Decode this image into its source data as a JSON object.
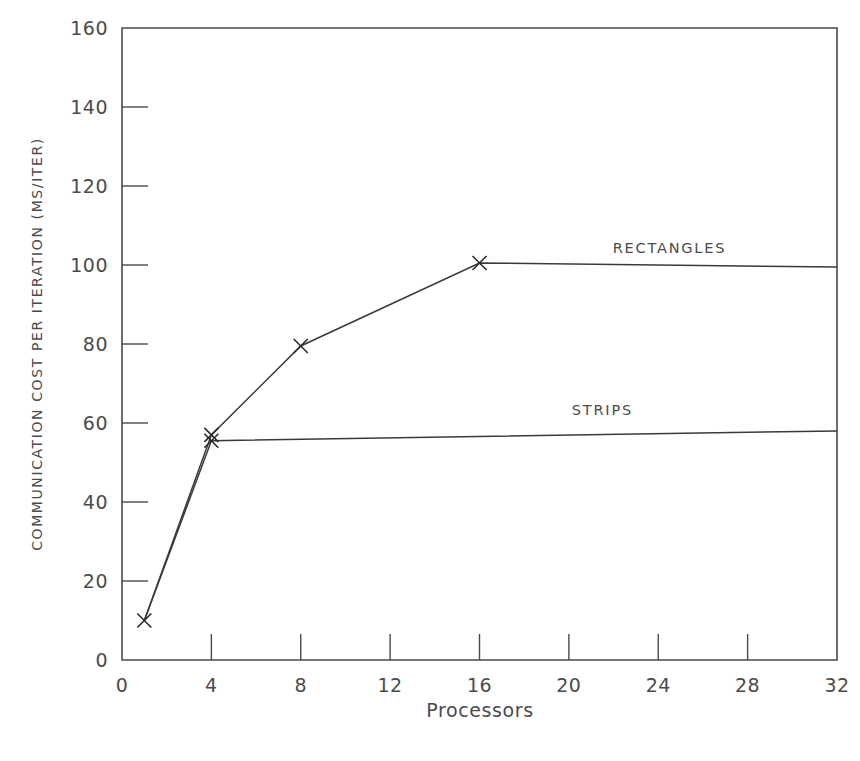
{
  "chart_data": {
    "type": "line",
    "title": "",
    "xlabel": "Processors",
    "ylabel": "COMMUNICATION COST PER ITERATION (MS/ITER)",
    "xlim": [
      0,
      32
    ],
    "ylim": [
      0,
      160
    ],
    "xticks": [
      0,
      4,
      8,
      12,
      16,
      20,
      24,
      28,
      32
    ],
    "yticks": [
      0,
      20,
      40,
      60,
      80,
      100,
      120,
      140,
      160
    ],
    "xtick_labels": [
      "0",
      "4",
      "8",
      "12",
      "16",
      "20",
      "24",
      "28",
      "32"
    ],
    "ytick_labels": [
      "0",
      "20",
      "40",
      "60",
      "80",
      "100",
      "120",
      "140",
      "160"
    ],
    "grid": false,
    "legend_position": "inline-right-of-series",
    "marker": "x",
    "series": [
      {
        "name": "RECTANGLES",
        "label_x": 24.5,
        "label_y": 103,
        "x": [
          1,
          4,
          8,
          16,
          32
        ],
        "y": [
          10,
          57,
          79.5,
          100.5,
          99.5
        ],
        "markers_at": [
          1,
          4,
          8,
          16
        ]
      },
      {
        "name": "STRIPS",
        "label_x": 21.5,
        "label_y": 62,
        "x": [
          1,
          4,
          32
        ],
        "y": [
          10,
          55.5,
          58
        ],
        "markers_at": [
          4
        ]
      }
    ]
  },
  "axis": {
    "x_title": "Processors",
    "y_title": "COMMUNICATION COST PER ITERATION (MS/ITER)"
  },
  "labels": {
    "rectangles": "RECTANGLES",
    "strips": "STRIPS"
  }
}
